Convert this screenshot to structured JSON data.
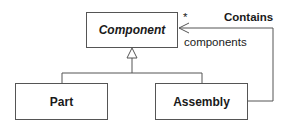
{
  "diagram": {
    "type": "UML class diagram (Composite pattern)",
    "classes": [
      {
        "id": "component",
        "name": "Component",
        "abstract": true
      },
      {
        "id": "part",
        "name": "Part",
        "abstract": false
      },
      {
        "id": "assembly",
        "name": "Assembly",
        "abstract": false
      }
    ],
    "relationships": [
      {
        "type": "generalization",
        "from": "part",
        "to": "component"
      },
      {
        "type": "generalization",
        "from": "assembly",
        "to": "component"
      },
      {
        "type": "association",
        "name": "Contains",
        "from": "assembly",
        "to": "component",
        "role": "components",
        "multiplicity": "*",
        "navigable": true
      }
    ],
    "labels": {
      "component": "Component",
      "part": "Part",
      "assembly": "Assembly",
      "association_name": "Contains",
      "role_name": "components",
      "multiplicity": "*"
    },
    "colors": {
      "line": "#555555",
      "text": "#1a1a1a",
      "background": "#ffffff"
    }
  }
}
